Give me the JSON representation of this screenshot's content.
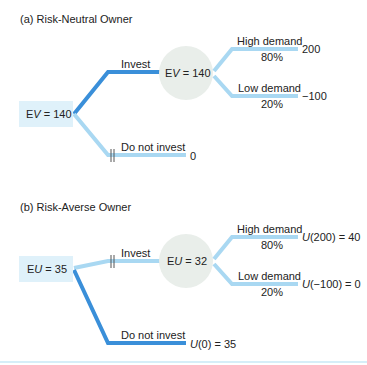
{
  "colors": {
    "chosen_branch": "#3a8fd9",
    "other_branch": "#a9d8f2",
    "decision_box": "#dff1fa",
    "chance_circle": "#e9eeea"
  },
  "panel_a": {
    "title": "(a) Risk-Neutral Owner",
    "decision_node": {
      "prefix": "E",
      "var": "V",
      "value": " = 140"
    },
    "chance_node": {
      "prefix": "E",
      "var": "V",
      "value": " = 140"
    },
    "invest_label": "Invest",
    "not_invest_label": "Do not invest",
    "not_invest_payoff": "0",
    "high_label": "High demand",
    "high_prob": "80%",
    "high_payoff": "200",
    "low_label": "Low demand",
    "low_prob": "20%",
    "low_payoff": "−100"
  },
  "panel_b": {
    "title": "(b) Risk-Averse Owner",
    "decision_node": {
      "prefix": "E",
      "var": "U",
      "value": " = 35"
    },
    "chance_node": {
      "prefix": "E",
      "var": "U",
      "value": " = 32"
    },
    "invest_label": "Invest",
    "not_invest_label": "Do not invest",
    "not_invest_payoff": {
      "fn": "U",
      "rest": "(0) = 35"
    },
    "high_label": "High demand",
    "high_prob": "80%",
    "high_payoff": {
      "fn": "U",
      "rest": "(200) = 40"
    },
    "low_label": "Low demand",
    "low_prob": "20%",
    "low_payoff": {
      "fn": "U",
      "rest": "(−100) = 0"
    }
  }
}
